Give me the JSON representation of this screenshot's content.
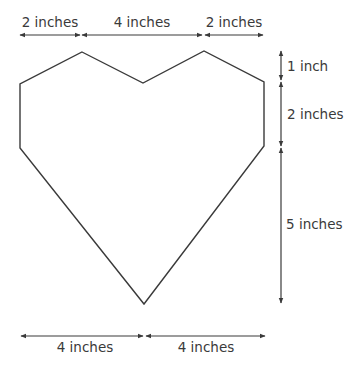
{
  "diagram": {
    "type": "dimensioned-heart-polygon",
    "stroke_color": "#3a3a3a",
    "shape_vertices": [
      [
        82,
        52
      ],
      [
        143,
        83
      ],
      [
        204,
        51
      ],
      [
        264,
        82
      ],
      [
        264,
        146
      ],
      [
        144,
        304
      ],
      [
        20,
        148
      ],
      [
        20,
        84
      ]
    ],
    "top_dimensions": [
      {
        "label": "2 inches",
        "x1": 20,
        "x2": 80,
        "y": 35
      },
      {
        "label": "4 inches",
        "x1": 82,
        "x2": 202,
        "y": 35
      },
      {
        "label": "2 inches",
        "x1": 205,
        "x2": 263,
        "y": 35
      }
    ],
    "right_dimensions": [
      {
        "label": "1 inch",
        "y1": 51,
        "y2": 80,
        "x": 281
      },
      {
        "label": "2 inches",
        "y1": 82,
        "y2": 146,
        "x": 281
      },
      {
        "label": "5 inches",
        "y1": 148,
        "y2": 303,
        "x": 281
      }
    ],
    "bottom_dimensions": [
      {
        "label": "4 inches",
        "x1": 21,
        "x2": 143,
        "y": 336
      },
      {
        "label": "4 inches",
        "x1": 146,
        "x2": 265,
        "y": 336
      }
    ]
  }
}
